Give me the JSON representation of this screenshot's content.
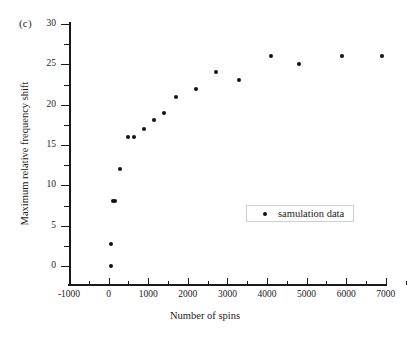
{
  "panel": {
    "label": "(c)"
  },
  "legend": {
    "entries": [
      {
        "label": "samulation data",
        "marker": "filled-circle",
        "color": "#111111"
      }
    ],
    "position": "inside-center-right"
  },
  "chart_data": {
    "type": "scatter",
    "title": "",
    "xlabel": "Number of spins",
    "ylabel": "Maximum relative frequency shift",
    "xlim": [
      -1000,
      7600
    ],
    "ylim": [
      -2.3,
      30
    ],
    "grid": false,
    "xticks": [
      -1000,
      0,
      1000,
      2000,
      3000,
      4000,
      5000,
      6000,
      7000
    ],
    "xticklabels": [
      "-1000",
      "0",
      "1000",
      "2000",
      "3000",
      "4000",
      "5000",
      "6000",
      "7000"
    ],
    "yticks": [
      0,
      5,
      10,
      15,
      20,
      25,
      30
    ],
    "yticklabels": [
      "0",
      "5",
      "10",
      "15",
      "20",
      "25",
      "30"
    ],
    "xminorticks": [
      -500,
      500,
      1500,
      2500,
      3500,
      4500,
      5500,
      6500,
      7500
    ],
    "yminorticks": [
      2.5,
      7.5,
      12.5,
      17.5,
      22.5,
      27.5
    ],
    "marker": "filled-circle",
    "marker_color": "#111111",
    "series": [
      {
        "name": "samulation data",
        "points": [
          {
            "x": 50,
            "y": 0.0
          },
          {
            "x": 50,
            "y": 2.7
          },
          {
            "x": 100,
            "y": 8.0
          },
          {
            "x": 150,
            "y": 8.0
          },
          {
            "x": 300,
            "y": 12.0
          },
          {
            "x": 500,
            "y": 16.0
          },
          {
            "x": 650,
            "y": 16.0
          },
          {
            "x": 900,
            "y": 17.0
          },
          {
            "x": 1150,
            "y": 18.1
          },
          {
            "x": 1400,
            "y": 19.0
          },
          {
            "x": 1700,
            "y": 21.0
          },
          {
            "x": 2200,
            "y": 22.0
          },
          {
            "x": 2700,
            "y": 24.0
          },
          {
            "x": 3300,
            "y": 23.0
          },
          {
            "x": 4100,
            "y": 26.0
          },
          {
            "x": 4800,
            "y": 25.0
          },
          {
            "x": 5900,
            "y": 26.0
          },
          {
            "x": 6900,
            "y": 26.0
          }
        ]
      }
    ]
  }
}
